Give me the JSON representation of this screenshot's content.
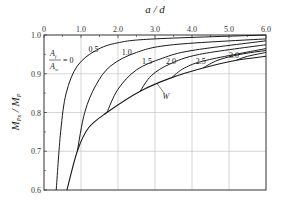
{
  "chart_data": {
    "type": "line",
    "title": "",
    "xlabel": "a / d",
    "ylabel": "M_Px / M_P",
    "xlim": [
      0,
      6.0
    ],
    "ylim": [
      0.6,
      1.0
    ],
    "x_ticks": [
      "0",
      "1.0",
      "2.0",
      "3.0",
      "4.0",
      "5.0",
      "6.0"
    ],
    "y_ticks": [
      "0.6",
      "0.7",
      "0.8",
      "0.9",
      "1.0"
    ],
    "x_axis_position": "top",
    "grid": true,
    "parameter_label": "A_f / A_w",
    "series": [
      {
        "name": "0",
        "points": [
          [
            0.33,
            0.6
          ],
          [
            0.45,
            0.75
          ],
          [
            0.6,
            0.85
          ],
          [
            0.9,
            0.92
          ],
          [
            1.4,
            0.96
          ],
          [
            2.0,
            0.98
          ],
          [
            3.0,
            0.99
          ],
          [
            6.0,
            1.0
          ]
        ]
      },
      {
        "name": "0.5",
        "points": [
          [
            0.9,
            0.7
          ],
          [
            1.1,
            0.8
          ],
          [
            1.4,
            0.87
          ],
          [
            1.8,
            0.92
          ],
          [
            2.5,
            0.955
          ],
          [
            3.5,
            0.975
          ],
          [
            6.0,
            0.99
          ]
        ]
      },
      {
        "name": "1.0",
        "points": [
          [
            1.7,
            0.8
          ],
          [
            2.0,
            0.86
          ],
          [
            2.5,
            0.91
          ],
          [
            3.2,
            0.94
          ],
          [
            4.0,
            0.96
          ],
          [
            6.0,
            0.985
          ]
        ]
      },
      {
        "name": "1.5",
        "points": [
          [
            2.6,
            0.855
          ],
          [
            2.9,
            0.895
          ],
          [
            3.4,
            0.925
          ],
          [
            4.2,
            0.95
          ],
          [
            6.0,
            0.975
          ]
        ]
      },
      {
        "name": "2.0",
        "points": [
          [
            3.45,
            0.89
          ],
          [
            3.8,
            0.915
          ],
          [
            4.4,
            0.935
          ],
          [
            6.0,
            0.965
          ]
        ]
      },
      {
        "name": "2.5",
        "points": [
          [
            4.3,
            0.915
          ],
          [
            4.7,
            0.935
          ],
          [
            5.3,
            0.95
          ],
          [
            6.0,
            0.96
          ]
        ]
      },
      {
        "name": "3.0",
        "points": [
          [
            5.2,
            0.935
          ],
          [
            5.5,
            0.945
          ],
          [
            6.0,
            0.955
          ]
        ]
      },
      {
        "name": "W",
        "points": [
          [
            0.62,
            0.6
          ],
          [
            0.9,
            0.7
          ],
          [
            1.2,
            0.76
          ],
          [
            1.7,
            0.8
          ],
          [
            2.6,
            0.855
          ],
          [
            3.45,
            0.89
          ],
          [
            4.3,
            0.915
          ],
          [
            5.2,
            0.935
          ],
          [
            6.0,
            0.945
          ]
        ]
      }
    ],
    "annotations": [
      "A_f/A_w = 0",
      "0.5",
      "1.0",
      "1.5",
      "2.0",
      "2.5",
      "3.0",
      "W"
    ]
  }
}
